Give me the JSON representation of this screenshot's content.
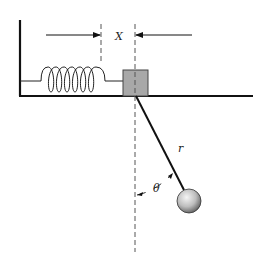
{
  "diagram": {
    "labels": {
      "displacement": "X",
      "length": "r",
      "angle": "θ"
    },
    "colors": {
      "line": "#111111",
      "block_fill": "#a8a8a8",
      "block_stroke": "#444444",
      "dash": "#555555",
      "ball_light": "#f2f2f2",
      "ball_dark": "#6f6f6f"
    },
    "components": [
      "wall",
      "ground",
      "spring",
      "mass-block",
      "pendulum-rod",
      "pendulum-bob",
      "reference-dashed-lines",
      "displacement-arrows",
      "angle-arc"
    ]
  }
}
